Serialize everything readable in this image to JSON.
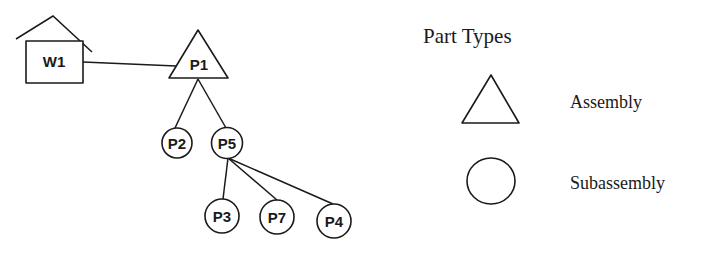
{
  "diagram": {
    "type": "part-hierarchy-tree",
    "colors": {
      "stroke": "#1a1a1a",
      "background": "#ffffff"
    },
    "nodes": [
      {
        "id": "W1",
        "label": "W1",
        "shape": "house"
      },
      {
        "id": "P1",
        "label": "P1",
        "shape": "triangle",
        "type": "Assembly"
      },
      {
        "id": "P2",
        "label": "P2",
        "shape": "circle",
        "type": "Subassembly"
      },
      {
        "id": "P5",
        "label": "P5",
        "shape": "circle",
        "type": "Subassembly"
      },
      {
        "id": "P3",
        "label": "P3",
        "shape": "circle",
        "type": "Subassembly"
      },
      {
        "id": "P7",
        "label": "P7",
        "shape": "circle",
        "type": "Subassembly"
      },
      {
        "id": "P4",
        "label": "P4",
        "shape": "circle",
        "type": "Subassembly"
      }
    ],
    "edges": [
      {
        "from": "W1",
        "to": "P1"
      },
      {
        "from": "P1",
        "to": "P2"
      },
      {
        "from": "P1",
        "to": "P5"
      },
      {
        "from": "P5",
        "to": "P3"
      },
      {
        "from": "P5",
        "to": "P7"
      },
      {
        "from": "P5",
        "to": "P4"
      }
    ]
  },
  "legend": {
    "title": "Part Types",
    "items": [
      {
        "shape": "triangle",
        "label": "Assembly"
      },
      {
        "shape": "circle",
        "label": "Subassembly"
      }
    ]
  }
}
